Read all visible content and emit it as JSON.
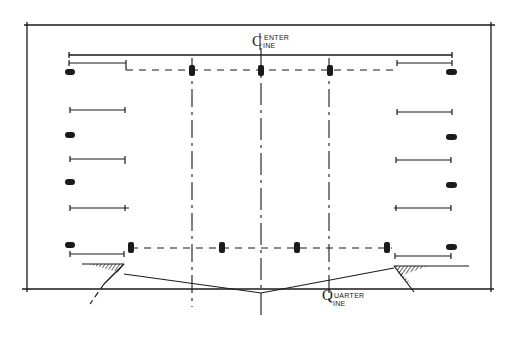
{
  "diagram": {
    "type": "parking lot layout sketch (plan view)",
    "stroke_color": "#1a1a1a",
    "background": "#ffffff",
    "labels": {
      "center_line": {
        "symbol": "C",
        "line1": "ENTER",
        "line2": "INE",
        "reads_as": "Center Line"
      },
      "quarter_line": {
        "symbol": "Q",
        "line1": "UARTER",
        "line2": "INE",
        "reads_as": "Quarter Line"
      }
    },
    "elements": {
      "frame": "outer rectangular boundary",
      "center_axis": "vertical center line (dash-dot)",
      "quarter_axes": "two vertical quarter lines (dash-dot)",
      "top_row": "dashed row line with 3 markers",
      "bottom_row": "dashed row line with 4 markers",
      "side_dimensions": "dimension bars on left and right sides",
      "side_markers": "filled markers on left and right sides",
      "slopes": "hatched embankments at lower left and right",
      "v_profile": "sloped ground line meeting at center"
    },
    "counts": {
      "left_dimension_bars": 6,
      "right_dimension_bars": 6,
      "left_markers": 5,
      "right_markers": 5,
      "top_row_markers": 3,
      "bottom_row_markers": 4
    }
  }
}
